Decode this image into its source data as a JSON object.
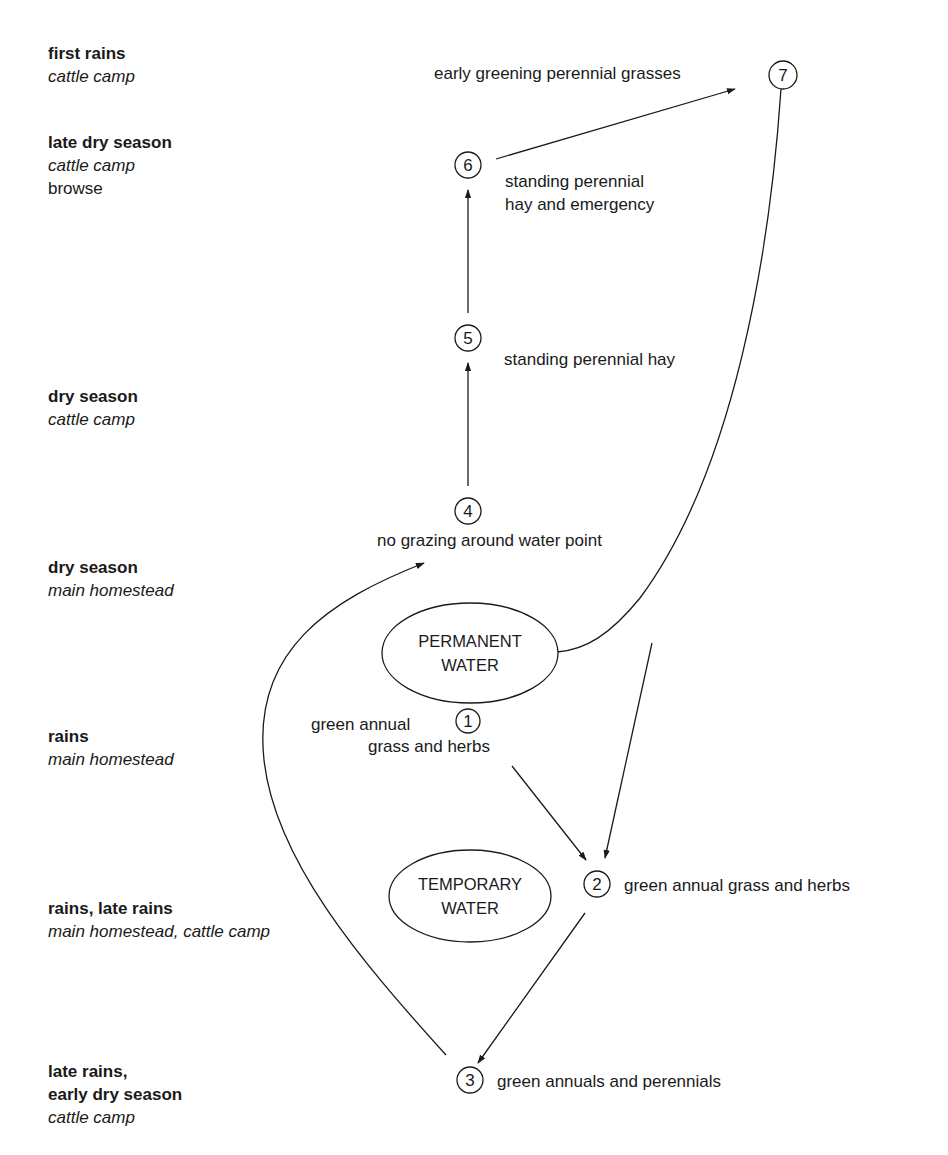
{
  "seasons": [
    {
      "title": "first rains",
      "place": "cattle camp"
    },
    {
      "title": "late dry season",
      "place": "cattle camp",
      "extra": "browse"
    },
    {
      "title": "dry season",
      "place": "cattle camp"
    },
    {
      "title": "dry season",
      "place": "main homestead"
    },
    {
      "title": "rains",
      "place": "main homestead"
    },
    {
      "title": "rains, late rains",
      "place": "main homestead, cattle camp"
    },
    {
      "title_line1": "late rains,",
      "title_line2": "early dry season",
      "place": "cattle camp"
    }
  ],
  "water_sources": {
    "permanent": {
      "line1": "PERMANENT",
      "line2": "WATER"
    },
    "temporary": {
      "line1": "TEMPORARY",
      "line2": "WATER"
    }
  },
  "nodes": [
    {
      "id": "1",
      "label_line1": "green annual",
      "label_line2": "grass and herbs"
    },
    {
      "id": "2",
      "label": "green annual grass and herbs"
    },
    {
      "id": "3",
      "label": "green annuals and perennials"
    },
    {
      "id": "4",
      "label": "no grazing around water point"
    },
    {
      "id": "5",
      "label": "standing perennial hay"
    },
    {
      "id": "6",
      "label_line1": "standing perennial",
      "label_line2": "hay and emergency"
    },
    {
      "id": "7",
      "label": "early greening perennial grasses"
    }
  ],
  "edges": [
    {
      "from": "1",
      "to": "2"
    },
    {
      "from": "permanent-water",
      "to": "2"
    },
    {
      "from": "2",
      "to": "3"
    },
    {
      "from": "3",
      "to": "4"
    },
    {
      "from": "4",
      "to": "5"
    },
    {
      "from": "5",
      "to": "6"
    },
    {
      "from": "6",
      "to": "7"
    },
    {
      "from": "7",
      "to": "permanent-water"
    }
  ],
  "colors": {
    "ink": "#1a1a1a",
    "background": "#ffffff"
  }
}
